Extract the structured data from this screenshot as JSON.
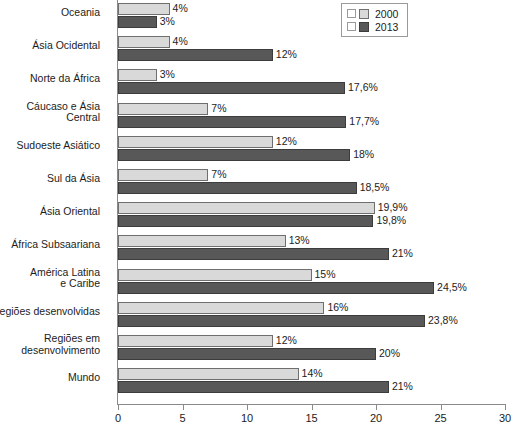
{
  "chart_data": {
    "type": "bar",
    "orientation": "horizontal",
    "title": "",
    "xlabel": "",
    "ylabel": "",
    "xlim": [
      0,
      30
    ],
    "xticks": [
      "0",
      "5",
      "10",
      "15",
      "20",
      "25",
      "30"
    ],
    "grid": false,
    "legend_position": "top-right",
    "categories": [
      "Oceania",
      "Ásia Ocidental",
      "Norte da África",
      "Cáucaso e Ásia\nCentral",
      "Sudoeste Asiático",
      "Sul da Ásia",
      "Ásia Oriental",
      "África Subsaariana",
      "América Latina\ne Caribe",
      "Regiões desenvolvidas",
      "Regiões em\ndesenvolvimento",
      "Mundo"
    ],
    "series": [
      {
        "name": "2000",
        "color": "#d9d9d9",
        "values": [
          4,
          4,
          3,
          7,
          12,
          7,
          19.9,
          13,
          15,
          16,
          12,
          14
        ],
        "labels": [
          "4%",
          "4%",
          "3%",
          "7%",
          "12%",
          "7%",
          "19,9%",
          "13%",
          "15%",
          "16%",
          "12%",
          "14%"
        ]
      },
      {
        "name": "2013",
        "color": "#585858",
        "values": [
          3,
          12,
          17.6,
          17.7,
          18,
          18.5,
          19.8,
          21,
          24.5,
          23.8,
          20,
          21
        ],
        "labels": [
          "3%",
          "12%",
          "17,6%",
          "17,7%",
          "18%",
          "18,5%",
          "19,8%",
          "21%",
          "24,5%",
          "23,8%",
          "20%",
          "21%"
        ]
      }
    ]
  },
  "legend": {
    "entries": [
      {
        "label": "2000"
      },
      {
        "label": "2013"
      }
    ]
  }
}
